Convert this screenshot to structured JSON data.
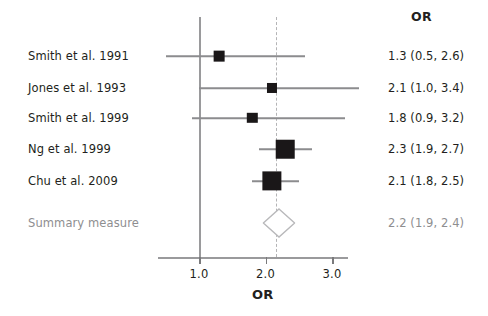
{
  "figure": {
    "type": "forest-plot",
    "column_header": "OR",
    "x_axis_title": "OR"
  },
  "chart_data": {
    "type": "scatter",
    "plot_kind": "forest",
    "title": "",
    "xlabel": "OR",
    "ylabel": "",
    "xlim": [
      0.4,
      3.3
    ],
    "grid": false,
    "legend": null,
    "column_headers": [
      "",
      "OR"
    ],
    "null_line_value": 1.0,
    "summary_reference_line_value": 2.2,
    "xticks": [
      1.0,
      2.0,
      3.0
    ],
    "xticklabels": [
      "1.0",
      "2.0",
      "3.0"
    ],
    "studies": [
      {
        "label": "Smith et al. 1991",
        "estimate": 1.3,
        "ci_low": 0.5,
        "ci_high": 2.6,
        "text": "1.3 (0.5, 2.6)",
        "weight_relative": 0.22
      },
      {
        "label": "Jones et al. 1993",
        "estimate": 2.1,
        "ci_low": 1.0,
        "ci_high": 3.4,
        "text": "2.1 (1.0, 3.4)",
        "weight_relative": 0.18
      },
      {
        "label": "Smith et al. 1999",
        "estimate": 1.8,
        "ci_low": 0.9,
        "ci_high": 3.2,
        "text": "1.8 (0.9, 3.2)",
        "weight_relative": 0.2
      },
      {
        "label": "Ng et al. 1999",
        "estimate": 2.3,
        "ci_low": 1.9,
        "ci_high": 2.7,
        "text": "2.3 (1.9, 2.7)",
        "weight_relative": 0.68
      },
      {
        "label": "Chu et al. 2009",
        "estimate": 2.1,
        "ci_low": 1.8,
        "ci_high": 2.5,
        "text": "2.1 (1.8, 2.5)",
        "weight_relative": 0.72
      }
    ],
    "summary": {
      "label": "Summary measure",
      "estimate": 2.2,
      "ci_low": 1.9,
      "ci_high": 2.4,
      "text": "2.2 (1.9, 2.4)"
    }
  },
  "colors": {
    "marker": "#1a1718",
    "line": "#8c8c8e",
    "null_line": "#9a9a9c",
    "dashed_line": "#b4b4b6",
    "text": "#231f20",
    "summary_text": "#8e8e90",
    "background": "#ffffff"
  }
}
